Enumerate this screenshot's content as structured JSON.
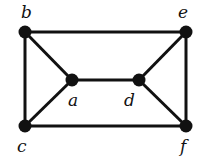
{
  "graph": {
    "nodes": [
      {
        "id": "b",
        "label": "b",
        "x": 25,
        "y": 32,
        "lx": 21,
        "ly": 4
      },
      {
        "id": "e",
        "label": "e",
        "x": 186,
        "y": 32,
        "lx": 178,
        "ly": 4
      },
      {
        "id": "a",
        "label": "a",
        "x": 72,
        "y": 80,
        "lx": 68,
        "ly": 92
      },
      {
        "id": "d",
        "label": "d",
        "x": 139,
        "y": 80,
        "lx": 124,
        "ly": 92
      },
      {
        "id": "c",
        "label": "c",
        "x": 25,
        "y": 126,
        "lx": 17,
        "ly": 138
      },
      {
        "id": "f",
        "label": "f",
        "x": 186,
        "y": 126,
        "lx": 180,
        "ly": 138
      }
    ],
    "edges": [
      [
        "b",
        "e"
      ],
      [
        "b",
        "c"
      ],
      [
        "b",
        "a"
      ],
      [
        "a",
        "c"
      ],
      [
        "a",
        "d"
      ],
      [
        "d",
        "e"
      ],
      [
        "d",
        "f"
      ],
      [
        "e",
        "f"
      ],
      [
        "c",
        "f"
      ]
    ],
    "colors": {
      "stroke": "#111111",
      "node": "#111111"
    }
  }
}
